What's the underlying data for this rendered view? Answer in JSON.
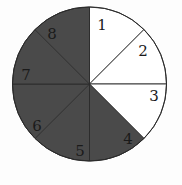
{
  "diagram": {
    "type": "circle-divided-into-sectors",
    "center": [
      89.5,
      84
    ],
    "radius": 77,
    "sector_count": 8,
    "colors": {
      "shaded": "#4a4a4a",
      "unshaded": "#ffffff",
      "stroke": "#2a2a2a"
    },
    "sectors": [
      {
        "label": "1",
        "shaded": false,
        "label_pos": [
          102,
          30
        ]
      },
      {
        "label": "2",
        "shaded": false,
        "label_pos": [
          143,
          56
        ]
      },
      {
        "label": "3",
        "shaded": false,
        "label_pos": [
          154,
          101
        ]
      },
      {
        "label": "4",
        "shaded": true,
        "label_pos": [
          128,
          144
        ]
      },
      {
        "label": "5",
        "shaded": true,
        "label_pos": [
          80,
          156
        ]
      },
      {
        "label": "6",
        "shaded": true,
        "label_pos": [
          37,
          131
        ]
      },
      {
        "label": "7",
        "shaded": true,
        "label_pos": [
          26,
          80
        ]
      },
      {
        "label": "8",
        "shaded": true,
        "label_pos": [
          52,
          39
        ]
      }
    ],
    "summary": {
      "shaded_count": 5,
      "unshaded_count": 3,
      "fraction_shaded": "5/8"
    }
  }
}
